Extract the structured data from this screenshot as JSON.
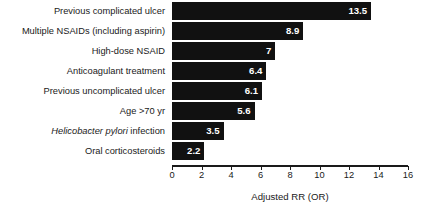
{
  "chart_data": {
    "type": "bar",
    "orientation": "horizontal",
    "title": "",
    "subtitle": "",
    "xlabel": "Adjusted RR (OR)",
    "ylabel": "",
    "xlim": [
      0,
      16
    ],
    "xticks": [
      0,
      2,
      4,
      6,
      8,
      10,
      12,
      14,
      16
    ],
    "xtick_labels": [
      "0",
      "2",
      "4",
      "6",
      "8",
      "10",
      "12",
      "14",
      "16"
    ],
    "grid": false,
    "legend": false,
    "bar_color": "#111111",
    "value_label_color": "#ffffff",
    "categories": [
      "Previous complicated ulcer",
      "Multiple NSAIDs (including aspirin)",
      "High-dose NSAID",
      "Anticoagulant treatment",
      "Previous uncomplicated ulcer",
      "Age >70 yr",
      "Helicobacter pylori infection",
      "Oral corticosteroids"
    ],
    "values": [
      13.5,
      8.9,
      7,
      6.4,
      6.1,
      5.6,
      3.5,
      2.2
    ],
    "value_labels": [
      "13.5",
      "8.9",
      "7",
      "6.4",
      "6.1",
      "5.6",
      "3.5",
      "2.2"
    ],
    "bars": [
      {
        "category": "Previous complicated ulcer",
        "value": 13.5,
        "label": "13.5",
        "italic_prefix": ""
      },
      {
        "category": "Multiple NSAIDs (including aspirin)",
        "value": 8.9,
        "label": "8.9",
        "italic_prefix": ""
      },
      {
        "category": "High-dose NSAID",
        "value": 7,
        "label": "7",
        "italic_prefix": ""
      },
      {
        "category": "Anticoagulant treatment",
        "value": 6.4,
        "label": "6.4",
        "italic_prefix": ""
      },
      {
        "category": "Previous uncomplicated ulcer",
        "value": 6.1,
        "label": "6.1",
        "italic_prefix": ""
      },
      {
        "category": "Age >70 yr",
        "value": 5.6,
        "label": "5.6",
        "italic_prefix": ""
      },
      {
        "category": "Helicobacter pylori infection",
        "value": 3.5,
        "label": "3.5",
        "italic_prefix": "Helicobacter pylori",
        "italic_suffix": " infection"
      },
      {
        "category": "Oral corticosteroids",
        "value": 2.2,
        "label": "2.2",
        "italic_prefix": ""
      }
    ],
    "annotations": []
  }
}
